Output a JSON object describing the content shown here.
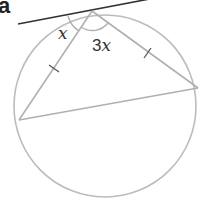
{
  "figure": {
    "label": "a",
    "angle_left": "x",
    "angle_right_coef": "3",
    "angle_right_var": "x"
  },
  "colors": {
    "circle": "#b8b8b8",
    "chords": "#b0b0b0",
    "tangent": "#333333",
    "text": "#333333"
  }
}
